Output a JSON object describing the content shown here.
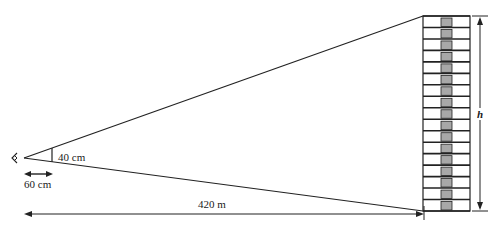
{
  "diagram": {
    "labels": {
      "object_size": "40 cm",
      "eye_to_object": "60 cm",
      "distance_to_building": "420 m",
      "building_height": "h"
    },
    "building": {
      "floors": 17,
      "fill_center": "#a8a8a8",
      "stroke": "#222222"
    },
    "colors": {
      "line": "#222222",
      "background": "#ffffff"
    }
  }
}
